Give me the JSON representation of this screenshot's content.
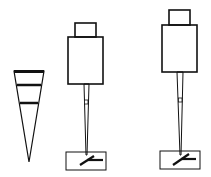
{
  "diagram": {
    "title": "",
    "colors": {
      "stroke": "#111111",
      "background": "#ffffff"
    },
    "elements": [
      {
        "id": "cone",
        "type": "conical-tip",
        "bands": 3
      },
      {
        "id": "device-1",
        "type": "pipette-with-cap-and-base"
      },
      {
        "id": "device-2",
        "type": "pipette-with-cap-and-base"
      }
    ]
  }
}
